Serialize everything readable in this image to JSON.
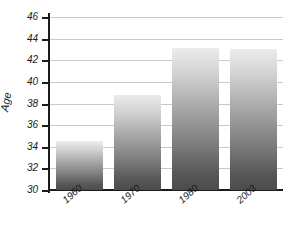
{
  "chart_data": {
    "type": "bar",
    "title": "",
    "subtitle": "",
    "xlabel": "",
    "ylabel": "Age",
    "categories": [
      "1960",
      "1970",
      "1980",
      "2003"
    ],
    "values": [
      34.5,
      38.8,
      43.1,
      43.0
    ],
    "series": [
      {
        "name": "Age",
        "values": [
          34.5,
          38.8,
          43.1,
          43.0
        ]
      }
    ],
    "ylim": [
      30,
      46
    ],
    "yticks": [
      30,
      32,
      34,
      36,
      38,
      40,
      42,
      44,
      46
    ],
    "ytick_labels": [
      "30",
      "32",
      "34",
      "36",
      "38",
      "40",
      "42",
      "44",
      "46"
    ],
    "xtick_labels": [
      "1960",
      "1970",
      "1980",
      "2003"
    ],
    "grid": "horizontal",
    "legend": "none",
    "annotations": [],
    "colors": {
      "bar_gradient_top": "#ececec",
      "bar_gradient_bottom": "#4c4c4c",
      "gridline": "#c9c9c9",
      "axis": "#1b1b1b",
      "text": "#1b1b1b",
      "background": "#ffffff"
    }
  }
}
